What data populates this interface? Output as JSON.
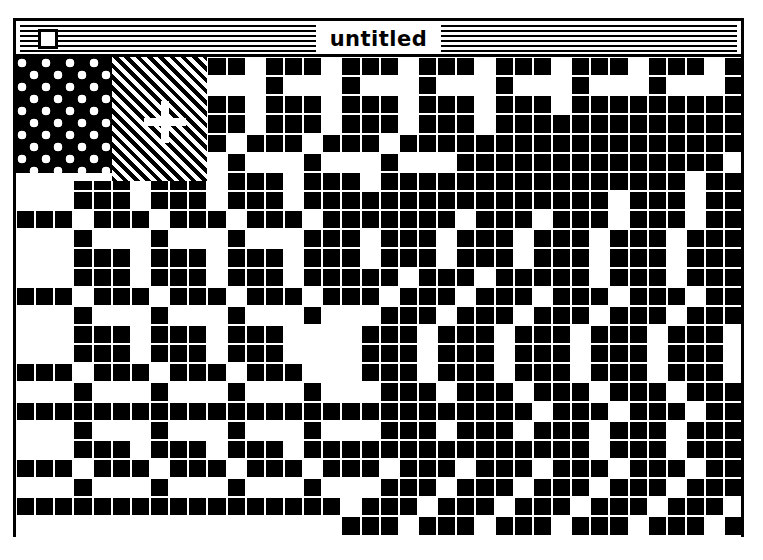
{
  "window": {
    "title": "untitled",
    "close_box": "close-box",
    "style": "classic-macintosh-window",
    "colors": {
      "ink": "#000000",
      "paper": "#ffffff",
      "desktop": "#ffffff"
    },
    "bounds": {
      "x": 13,
      "y": 18,
      "width": 731,
      "height": 519
    }
  },
  "canvas": {
    "mode": "FatBits",
    "grid": {
      "columns": 38,
      "rows": 25,
      "cell_px": 19
    },
    "tools": {
      "cursor": "crosshair-cursor",
      "pattern_swatch_dots": "dots-pattern-swatch",
      "pattern_swatch_hatch": "diagonal-hatch-pattern-swatch"
    },
    "bitmap": [
      "00000000011101110111011101110111011101",
      "00000000010001000100010001000100010001",
      "00000000011101110111011101110111111111",
      "00000000011101110111011101111111111111",
      "11101110111011101110111111111111111111",
      "00010001000100010001000111111111111110",
      "00011101110111011101111111111111111011",
      "00011101110111011111111111111110111011",
      "11101110111011101111111011101110111011",
      "00010001000100011101110111011101110111",
      "00011101110111011101110111011101110111",
      "00011101110111011111011101111101110111",
      "11101110111011101110111011101110111011",
      "00010001000100010001110111011101110111",
      "00011101110111000011101110111011101110",
      "00011101110111000011101110111011101110",
      "11101110111011100011101110111011101110",
      "00010001000100010001110111011101110111",
      "11111111111111111111111111101110111011",
      "00010001000100010001110111011101110111",
      "00011101110111011111111111111101110111",
      "11101110111011101110111011101110111011",
      "00010001000100010001110111011101110111",
      "11111111111111111011101110111011101110",
      "00000000000000000111011101110111011101"
    ]
  }
}
